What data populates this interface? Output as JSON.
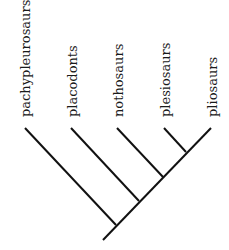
{
  "diagram": {
    "type": "cladogram",
    "taxa": [
      {
        "label": "pachypleurosaurs"
      },
      {
        "label": "placodonts"
      },
      {
        "label": "nothosaurs"
      },
      {
        "label": "plesiosaurs"
      },
      {
        "label": "pliosaurs"
      }
    ],
    "line_color": "#111111",
    "background": "#ffffff"
  }
}
